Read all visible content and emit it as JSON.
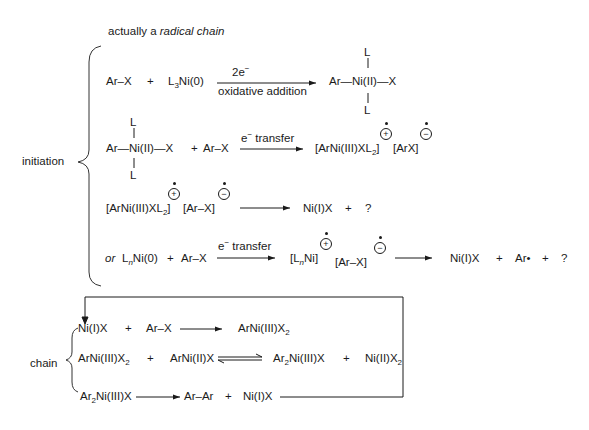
{
  "header": {
    "note_prefix": "actually a ",
    "note_italic": "radical chain"
  },
  "labels": {
    "initiation": "initiation",
    "chain": "chain"
  },
  "initiation": {
    "step1": {
      "reactant1": "Ar–X",
      "plus": "+",
      "reactant2_pre": "L",
      "reactant2_sub": "3",
      "reactant2_post": "Ni(0)",
      "arrow_above": "2e",
      "arrow_above_sup": "−",
      "arrow_below": "oxidative addition",
      "product_center": "Ar—Ni(II)—X",
      "ligand_top": "L",
      "ligand_bottom": "L"
    },
    "step2": {
      "reactant1": "Ar—Ni(II)—X",
      "ligand_top": "L",
      "ligand_bottom": "L",
      "plus": "+",
      "reactant2": "Ar–X",
      "arrow_above": "e",
      "arrow_above_sup": "−",
      "arrow_above_rest": " transfer",
      "product1_pre": "[ArNi(III)XL",
      "product1_sub": "2",
      "product1_post": "]",
      "product1_charge": "+",
      "product2": "[ArX]",
      "product2_charge": "−"
    },
    "step3": {
      "reactant1_pre": "[ArNi(III)XL",
      "reactant1_sub": "2",
      "reactant1_post": "]",
      "reactant1_charge": "+",
      "reactant2": "[Ar–X]",
      "reactant2_charge": "−",
      "product1": "Ni(I)X",
      "plus": "+",
      "product2": "?"
    },
    "step4": {
      "prefix_italic": "or",
      "reactant1_pre": "L",
      "reactant1_sub": "n",
      "reactant1_post": "Ni(0)",
      "plus": "+",
      "reactant2": "Ar–X",
      "arrow_above": "e",
      "arrow_above_sup": "−",
      "arrow_above_rest": " transfer",
      "intermediate1_pre": "[L",
      "intermediate1_sub": "n",
      "intermediate1_post": "Ni]",
      "intermediate1_charge": "+",
      "intermediate2": "[Ar–X]",
      "intermediate2_charge": "−",
      "product1": "Ni(I)X",
      "plus2": "+",
      "product2": "Ar•",
      "plus3": "+",
      "product3": "?"
    }
  },
  "chain": {
    "step1": {
      "reactant1": "Ni(I)X",
      "plus": "+",
      "reactant2": "Ar–X",
      "product_pre": "ArNi(III)X",
      "product_sub": "2"
    },
    "step2": {
      "reactant1_pre": "ArNi(III)X",
      "reactant1_sub": "2",
      "plus": "+",
      "reactant2": "ArNi(II)X",
      "product1_pre": "Ar",
      "product1_sub": "2",
      "product1_post": "Ni(III)X",
      "plus2": "+",
      "product2_pre": "Ni(II)X",
      "product2_sub": "2"
    },
    "step3": {
      "reactant_pre": "Ar",
      "reactant_sub": "2",
      "reactant_post": "Ni(III)X",
      "product1": "Ar–Ar",
      "plus": "+",
      "product2": "Ni(I)X"
    }
  }
}
